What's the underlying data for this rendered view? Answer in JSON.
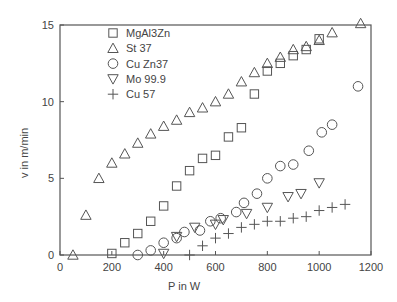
{
  "chart_data": {
    "type": "scatter",
    "title": "",
    "xlabel": "P in W",
    "ylabel": "v in m/min",
    "xlim": [
      0,
      1200
    ],
    "ylim": [
      0,
      15
    ],
    "xticks": [
      0,
      200,
      400,
      600,
      800,
      1000,
      1200
    ],
    "yticks": [
      0,
      5,
      10,
      15
    ],
    "grid": false,
    "legend_position": "upper-left-inside",
    "series": [
      {
        "name": "MgAl3Zn",
        "marker": "square",
        "x": [
          200,
          250,
          300,
          350,
          400,
          450,
          500,
          550,
          600,
          650,
          700,
          750,
          800,
          850,
          900,
          950,
          1000
        ],
        "y": [
          0.1,
          0.8,
          1.4,
          2.2,
          3.2,
          4.5,
          5.5,
          6.3,
          6.5,
          7.7,
          8.3,
          10.5,
          12.0,
          12.5,
          13.0,
          13.4,
          14.1
        ]
      },
      {
        "name": "St  37",
        "marker": "triangle-up",
        "x": [
          50,
          100,
          150,
          200,
          250,
          300,
          350,
          400,
          450,
          500,
          550,
          600,
          650,
          700,
          750,
          800,
          850,
          900,
          950,
          1000,
          1050,
          1160
        ],
        "y": [
          0.0,
          2.6,
          5.0,
          6.0,
          6.6,
          7.3,
          7.9,
          8.4,
          8.8,
          9.3,
          9.6,
          10.0,
          10.5,
          11.3,
          11.9,
          12.5,
          12.9,
          13.4,
          13.6,
          14.0,
          14.5,
          15.1
        ]
      },
      {
        "name": "Cu Zn37",
        "marker": "circle",
        "x": [
          300,
          350,
          400,
          450,
          480,
          540,
          580,
          620,
          680,
          710,
          760,
          800,
          850,
          900,
          960,
          1010,
          1050,
          1150
        ],
        "y": [
          0.0,
          0.3,
          0.8,
          1.1,
          1.5,
          1.6,
          2.2,
          2.4,
          2.8,
          3.4,
          4.0,
          5.0,
          5.8,
          5.9,
          6.8,
          8.0,
          8.5,
          11.0
        ]
      },
      {
        "name": "Mo 99.9",
        "marker": "triangle-down",
        "x": [
          400,
          450,
          520,
          600,
          630,
          720,
          800,
          880,
          930,
          1000
        ],
        "y": [
          0.1,
          1.2,
          1.8,
          2.0,
          2.3,
          2.7,
          3.1,
          3.8,
          4.0,
          4.7
        ]
      },
      {
        "name": "Cu 57",
        "marker": "plus",
        "x": [
          500,
          550,
          600,
          650,
          700,
          750,
          800,
          850,
          900,
          950,
          1000,
          1050,
          1100
        ],
        "y": [
          0.0,
          0.6,
          1.1,
          1.4,
          1.8,
          2.0,
          2.2,
          2.2,
          2.4,
          2.5,
          2.9,
          3.1,
          3.3
        ]
      }
    ]
  },
  "axes": {
    "xlabel": "P in W",
    "ylabel": "v in m/min",
    "xtick_labels": [
      "0",
      "200",
      "400",
      "600",
      "800",
      "1000",
      "1200"
    ],
    "ytick_labels": [
      "0",
      "5",
      "10",
      "15"
    ]
  },
  "legend": {
    "items": [
      {
        "label": "MgAl3Zn",
        "marker": "square"
      },
      {
        "label": "St  37",
        "marker": "triangle-up"
      },
      {
        "label": "Cu Zn37",
        "marker": "circle"
      },
      {
        "label": "Mo 99.9",
        "marker": "triangle-down"
      },
      {
        "label": "Cu 57",
        "marker": "plus"
      }
    ]
  },
  "colors": {
    "axis": "#555555",
    "marker": "#555555",
    "text": "#444444"
  }
}
